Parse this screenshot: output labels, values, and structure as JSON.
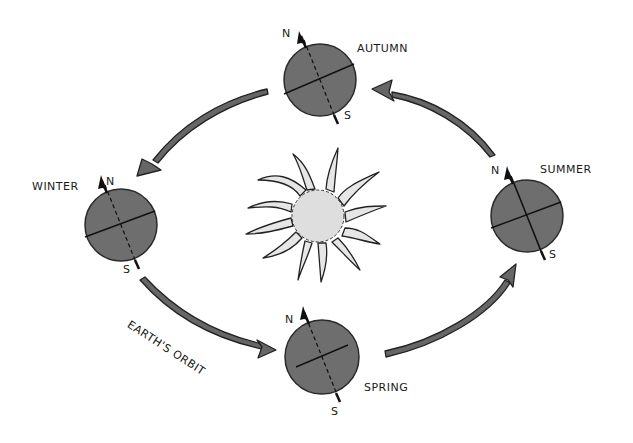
{
  "diagram": {
    "title": "",
    "colors": {
      "globe_fill": "#6e6e6e",
      "globe_stroke": "#2a2a2a",
      "arrow_fill": "#666666",
      "sun_fill": "#dedede",
      "ray_fill": "#e6e6e6",
      "ink": "#1a1a1a",
      "background": "#ffffff"
    },
    "sun": {
      "label": "",
      "cx": 318,
      "cy": 216,
      "r": 26
    },
    "orbit_label": "EARTH'S ORBIT",
    "seasons": [
      {
        "id": "autumn",
        "label": "AUTUMN",
        "north": "N",
        "south": "S",
        "cx": 320,
        "cy": 80,
        "r": 36
      },
      {
        "id": "winter",
        "label": "WINTER",
        "north": "N",
        "south": "S",
        "cx": 121,
        "cy": 225,
        "r": 36
      },
      {
        "id": "summer",
        "label": "SUMMER",
        "north": "N",
        "south": "S",
        "cx": 527,
        "cy": 216,
        "r": 36
      },
      {
        "id": "spring",
        "label": "SPRING",
        "north": "N",
        "south": "S",
        "cx": 322,
        "cy": 357,
        "r": 37
      }
    ],
    "arrows": [
      {
        "from": "autumn",
        "to": "winter"
      },
      {
        "from": "winter",
        "to": "spring"
      },
      {
        "from": "spring",
        "to": "summer"
      },
      {
        "from": "summer",
        "to": "autumn"
      }
    ]
  }
}
